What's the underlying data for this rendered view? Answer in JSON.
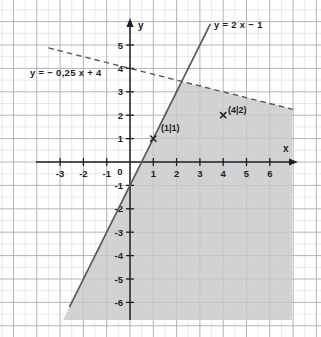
{
  "chart_data": {
    "type": "line",
    "title": "",
    "xlabel": "x",
    "ylabel": "y",
    "xlim": [
      -3.8,
      7.1
    ],
    "ylim": [
      -7.0,
      5.9
    ],
    "grid": true,
    "grid_minor_step": 0.5,
    "grid_major_step": 1,
    "legend": "inline-labels",
    "xticks": [
      -3,
      -2,
      -1,
      0,
      1,
      2,
      3,
      4,
      5,
      6
    ],
    "xtick_labels": [
      "-3",
      "-2",
      "-1",
      "0",
      "1",
      "2",
      "3",
      "4",
      "5",
      "6"
    ],
    "yticks": [
      -6,
      -5,
      -4,
      -3,
      -2,
      -1,
      1,
      2,
      3,
      4,
      5
    ],
    "ytick_labels": [
      "-6",
      "-5",
      "-4",
      "-3",
      "-2",
      "-1",
      "1",
      "2",
      "3",
      "4",
      "5"
    ],
    "origin_label": "0",
    "series": [
      {
        "name": "y = 2 x − 1",
        "label": "y = 2 x − 1",
        "style": "solid",
        "slope": 2,
        "intercept": -1,
        "color": "#58595b",
        "x_range": [
          -2.6,
          3.45
        ],
        "label_position": "top-right"
      },
      {
        "name": "y = − 0,25 x + 4",
        "label": "y = − 0,25 x + 4",
        "style": "dashed",
        "slope": -0.25,
        "intercept": 4,
        "color": "#58595b",
        "x_range": [
          -3.5,
          7.0
        ],
        "label_position": "upper-left"
      }
    ],
    "shaded_region": {
      "description": "region right of y = 2x - 1 and below y = -0,25 x + 4",
      "color": "#c8c8c8",
      "opacity": 0.75
    },
    "points": [
      {
        "x": 1,
        "y": 1,
        "label": "(1|1)",
        "marker": "x"
      },
      {
        "x": 4,
        "y": 2,
        "label": "(4|2)",
        "marker": "x"
      }
    ]
  },
  "colors": {
    "grid_minor": "#d9dce3",
    "grid_major": "#aab0bd",
    "axis": "#231f20",
    "line": "#58595b",
    "shade": "#c7c8c9",
    "text": "#231f20",
    "background": "#ffffff"
  },
  "labels": {
    "axis_x": "x",
    "axis_y": "y",
    "origin": "0",
    "equation_line_solid": "y = 2 x − 1",
    "equation_line_dashed": "y = − 0,25 x + 4",
    "point_one": "(1|1)",
    "point_two": "(4|2)",
    "marker_glyph": "×"
  }
}
